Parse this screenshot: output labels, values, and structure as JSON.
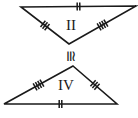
{
  "figure": {
    "type": "geometry-diagram",
    "background_color": "#ffffff",
    "stroke_color": "#1a1a1a",
    "canvas": {
      "width": 138,
      "height": 118
    },
    "congruence_symbol": {
      "glyph": "≅",
      "name": "congruent-to-symbol",
      "rotation_degrees": 90,
      "x": 69,
      "y": 56
    },
    "triangles": [
      {
        "id": "triangle-top",
        "label": "II",
        "label_x": 71,
        "label_y": 27,
        "vertices": [
          {
            "name": "top-left",
            "x": 21,
            "y": 7
          },
          {
            "name": "top-right",
            "x": 136,
            "y": 6
          },
          {
            "name": "apex-bottom",
            "x": 69,
            "y": 44
          }
        ],
        "sides": [
          {
            "name": "top-side",
            "from": "top-left",
            "to": "top-right",
            "ticks": 2
          },
          {
            "name": "left-side",
            "from": "top-left",
            "to": "apex-bottom",
            "ticks": 3
          },
          {
            "name": "right-side",
            "from": "top-right",
            "to": "apex-bottom",
            "ticks": 4
          }
        ]
      },
      {
        "id": "triangle-bottom",
        "label": "IV",
        "label_x": 66,
        "label_y": 87,
        "vertices": [
          {
            "name": "apex-top",
            "x": 73,
            "y": 66
          },
          {
            "name": "bottom-right",
            "x": 117,
            "y": 104
          },
          {
            "name": "bottom-left",
            "x": 4,
            "y": 104
          }
        ],
        "sides": [
          {
            "name": "bottom-side",
            "from": "bottom-left",
            "to": "bottom-right",
            "ticks": 2
          },
          {
            "name": "left-side",
            "from": "bottom-left",
            "to": "apex-top",
            "ticks": 4
          },
          {
            "name": "right-side",
            "from": "apex-top",
            "to": "bottom-right",
            "ticks": 3
          }
        ]
      }
    ]
  }
}
